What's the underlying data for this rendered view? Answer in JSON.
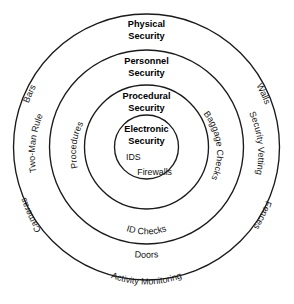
{
  "diagram": {
    "type": "concentric-rings",
    "background_color": "#ffffff",
    "stroke_color": "#1a1a1a",
    "text_color": "#000000",
    "center": {
      "x": 146.5,
      "y": 147
    },
    "layers": [
      {
        "id": "physical-security",
        "title": "Physical Security",
        "title_line1": "Physical",
        "title_line2": "Security",
        "radius": 133,
        "level": 1,
        "items": [
          {
            "label": "Bars",
            "position": "upper-left"
          },
          {
            "label": "Walls",
            "position": "upper-right"
          },
          {
            "label": "Cameras",
            "position": "lower-left"
          },
          {
            "label": "Fences",
            "position": "lower-right"
          },
          {
            "label": "Doors",
            "position": "bottom"
          }
        ]
      },
      {
        "id": "personnel-security",
        "title": "Personnel Security",
        "title_line1": "Personnel",
        "title_line2": "Security",
        "radius": 97,
        "level": 2,
        "items": [
          {
            "label": "Two-Man Rule",
            "position": "left"
          },
          {
            "label": "Security Vetting",
            "position": "right"
          },
          {
            "label": "Activity Monitoring",
            "position": "bottom"
          }
        ]
      },
      {
        "id": "procedural-security",
        "title": "Procedural Security",
        "title_line1": "Procedural",
        "title_line2": "Security",
        "radius": 62,
        "level": 3,
        "items": [
          {
            "label": "Procedures",
            "position": "left"
          },
          {
            "label": "Baggage Checks",
            "position": "right"
          },
          {
            "label": "ID Checks",
            "position": "bottom"
          }
        ]
      },
      {
        "id": "electronic-security",
        "title": "Electronic Security",
        "title_line1": "Electronic",
        "title_line2": "Security",
        "radius": 32,
        "level": 4,
        "items": [
          {
            "label": "IDS",
            "position": "core-left"
          },
          {
            "label": "Firewalls",
            "position": "core-right"
          }
        ]
      }
    ]
  }
}
